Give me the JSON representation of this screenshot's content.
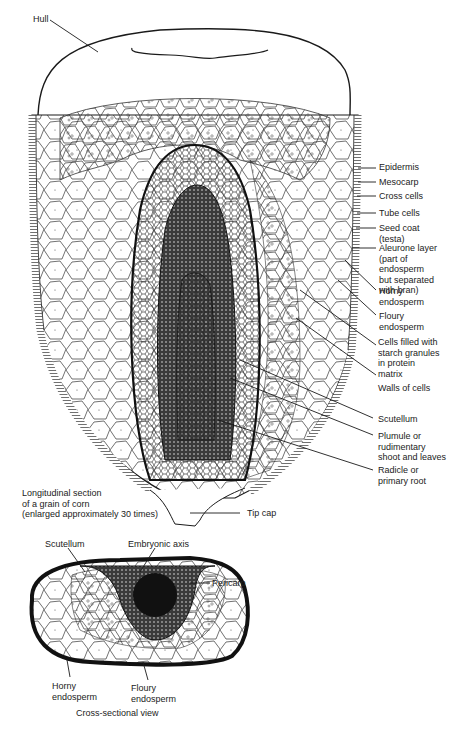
{
  "figure": {
    "title_long": "Longitudinal section\nof a grain of corn\n(enlarged approximately 30 times)",
    "title_cross": "Cross-sectional view",
    "colors": {
      "ink": "#1a1a1a",
      "paper": "#ffffff",
      "cell_fill": "#f4f4f4",
      "embryo_dark": "#2a2a2a"
    }
  },
  "longitudinal_labels": [
    {
      "id": "hull",
      "text": "Hull"
    },
    {
      "id": "epidermis",
      "text": "Epidermis"
    },
    {
      "id": "mesocarp",
      "text": "Mesocarp"
    },
    {
      "id": "cross-cells",
      "text": "Cross cells"
    },
    {
      "id": "tube-cells",
      "text": "Tube cells"
    },
    {
      "id": "seed-coat",
      "text": "Seed coat\n(testa)"
    },
    {
      "id": "aleurone-layer",
      "text": "Aleurone layer\n(part of\nendosperm\nbut separated\nwith bran)"
    },
    {
      "id": "horny-endosperm",
      "text": "Horny\nendosperm"
    },
    {
      "id": "floury-endosperm",
      "text": "Floury\nendosperm"
    },
    {
      "id": "starch-cells",
      "text": "Cells filled with\nstarch granules\nin protein\nmatrix"
    },
    {
      "id": "cell-walls",
      "text": "Walls of cells"
    },
    {
      "id": "scutellum",
      "text": "Scutellum"
    },
    {
      "id": "plumule",
      "text": "Plumule or\nrudimentary\nshoot and leaves"
    },
    {
      "id": "radicle",
      "text": "Radicle or\nprimary root"
    },
    {
      "id": "tip-cap",
      "text": "Tip cap"
    }
  ],
  "cross_labels": [
    {
      "id": "scutellum",
      "text": "Scutellum"
    },
    {
      "id": "embryonic-axis",
      "text": "Embryonic axis"
    },
    {
      "id": "pericarp",
      "text": "Pericarp"
    },
    {
      "id": "horny-endosperm",
      "text": "Horny\nendosperm"
    },
    {
      "id": "floury-endosperm",
      "text": "Floury\nendosperm"
    }
  ]
}
